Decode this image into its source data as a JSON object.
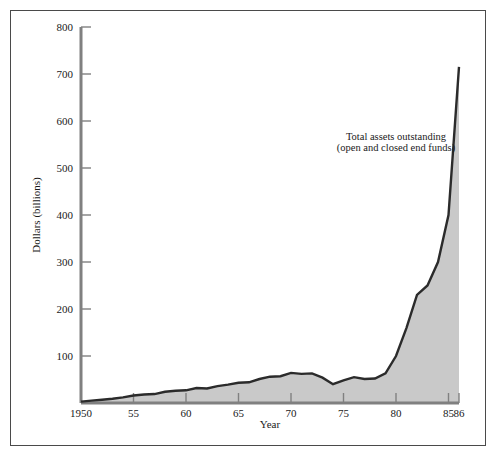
{
  "chart_data": {
    "type": "area",
    "title": "",
    "xlabel": "Year",
    "ylabel": "Dollars (billions)",
    "xlim": [
      1950,
      1986
    ],
    "ylim": [
      0,
      800
    ],
    "grid": false,
    "legend": "none",
    "annotations": [
      {
        "name": "series-annotation",
        "line1": "Total assets outstanding",
        "line2": "(open and closed end funds)",
        "x": 1978.5,
        "y": 520
      }
    ],
    "xticks": [
      {
        "value": 1950,
        "label": "1950"
      },
      {
        "value": 1955,
        "label": "55"
      },
      {
        "value": 1960,
        "label": "60"
      },
      {
        "value": 1965,
        "label": "65"
      },
      {
        "value": 1970,
        "label": "70"
      },
      {
        "value": 1975,
        "label": "75"
      },
      {
        "value": 1980,
        "label": "80"
      },
      {
        "value": 1985,
        "label": "85"
      },
      {
        "value": 1986,
        "label": "86"
      }
    ],
    "yticks": [
      {
        "value": 100,
        "label": "100"
      },
      {
        "value": 200,
        "label": "200"
      },
      {
        "value": 300,
        "label": "300"
      },
      {
        "value": 400,
        "label": "400"
      },
      {
        "value": 500,
        "label": "500"
      },
      {
        "value": 600,
        "label": "600"
      },
      {
        "value": 700,
        "label": "700"
      },
      {
        "value": 800,
        "label": "800"
      }
    ],
    "series": [
      {
        "name": "Total assets outstanding (open and closed end funds)",
        "x": [
          1950,
          1951,
          1952,
          1953,
          1954,
          1955,
          1956,
          1957,
          1958,
          1959,
          1960,
          1961,
          1962,
          1963,
          1964,
          1965,
          1966,
          1967,
          1968,
          1969,
          1970,
          1971,
          1972,
          1973,
          1974,
          1975,
          1976,
          1977,
          1978,
          1979,
          1980,
          1981,
          1982,
          1983,
          1984,
          1985,
          1986
        ],
        "y": [
          3,
          5,
          7,
          9,
          12,
          16,
          18,
          19,
          24,
          26,
          27,
          32,
          31,
          36,
          39,
          43,
          44,
          51,
          56,
          57,
          64,
          62,
          63,
          54,
          40,
          48,
          55,
          51,
          52,
          63,
          100,
          160,
          230,
          250,
          300,
          400,
          715
        ]
      }
    ],
    "colors": {
      "line": "#2b2b2b",
      "fill": "#c9c9c9",
      "axis": "#808080",
      "frame": "#4a4a4a",
      "text": "#1a1a1a"
    }
  }
}
